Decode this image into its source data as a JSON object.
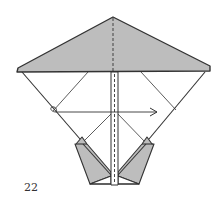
{
  "diagram": {
    "type": "origami-fold-step",
    "step_number": "22",
    "colors": {
      "paper_colored": "#bdbdbd",
      "paper_white": "#ffffff",
      "line": "#333333"
    },
    "symbols": [
      {
        "name": "valley-fold-line",
        "description": "dashed vertical center line"
      },
      {
        "name": "fold-arrow",
        "description": "horizontal arrow pointing right, looping at left"
      }
    ]
  }
}
